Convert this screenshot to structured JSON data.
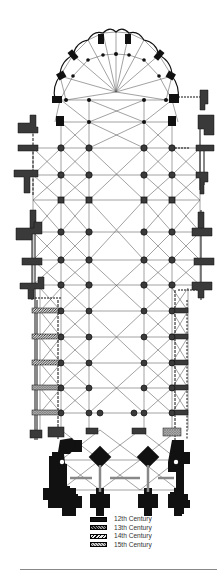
{
  "figure": {
    "orientation": "choir/apse at top, west facade at bottom"
  },
  "legend": {
    "items": [
      {
        "label": "12th Century",
        "pattern": "solid-black"
      },
      {
        "label": "13th Century",
        "pattern": "dense-crosshatch"
      },
      {
        "label": "14th Century",
        "pattern": "diagonal-hatch"
      },
      {
        "label": "15th Century",
        "pattern": "light-crosshatch"
      }
    ]
  },
  "colors": {
    "ink": "#111111",
    "line": "#555555",
    "rule": "#888888",
    "background": "#ffffff"
  }
}
